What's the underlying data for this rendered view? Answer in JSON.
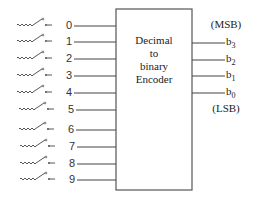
{
  "diagram": {
    "title": "Decimal to binary Encoder",
    "block": {
      "lines": [
        "Decimal",
        "to",
        "binary",
        "Encoder"
      ]
    },
    "inputs": [
      {
        "label": "0"
      },
      {
        "label": "1"
      },
      {
        "label": "2"
      },
      {
        "label": "3"
      },
      {
        "label": "4"
      },
      {
        "label": "5"
      },
      {
        "label": "6"
      },
      {
        "label": "7"
      },
      {
        "label": "8"
      },
      {
        "label": "9"
      }
    ],
    "outputs": [
      {
        "name": "b",
        "sub": "3"
      },
      {
        "name": "b",
        "sub": "2"
      },
      {
        "name": "b",
        "sub": "1"
      },
      {
        "name": "b",
        "sub": "0"
      }
    ],
    "msb_label": "(MSB)",
    "lsb_label": "(LSB)",
    "colors": {
      "line": "#444444",
      "text": "#222222",
      "background": "#ffffff"
    }
  }
}
